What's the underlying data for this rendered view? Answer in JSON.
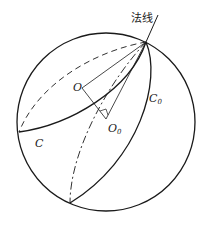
{
  "labels": {
    "normal_line": "法线",
    "center_O": "O",
    "center_O0": "O",
    "center_O0_sub": "0",
    "curve_C": "C",
    "curve_C0": "C",
    "curve_C0_sub": "0"
  },
  "colors": {
    "stroke": "#1a1a1a",
    "background": "#ffffff"
  }
}
